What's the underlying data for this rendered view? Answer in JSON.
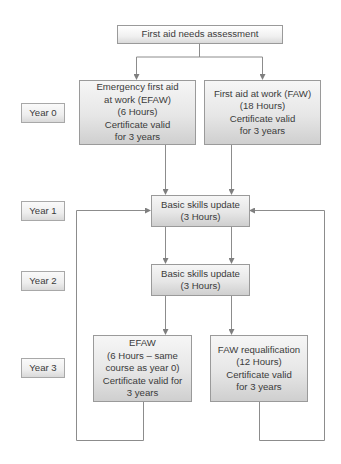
{
  "diagram": {
    "title": "First aid needs assessment",
    "years": [
      {
        "label": "Year 0"
      },
      {
        "label": "Year 1"
      },
      {
        "label": "Year 2"
      },
      {
        "label": "Year 3"
      }
    ],
    "nodes": {
      "assessment": {
        "lines": [
          "First aid needs assessment"
        ]
      },
      "efaw_year0": {
        "lines": [
          "Emergency first aid",
          "at work (EFAW)",
          "(6 Hours)",
          "Certificate valid",
          "for 3 years"
        ]
      },
      "faw_year0": {
        "lines": [
          "First aid at work (FAW)",
          "(18 Hours)",
          "Certificate valid",
          "for 3 years"
        ]
      },
      "basic_year1": {
        "lines": [
          "Basic skills update",
          "(3 Hours)"
        ]
      },
      "basic_year2": {
        "lines": [
          "Basic skills update",
          "(3 Hours)"
        ]
      },
      "efaw_year3": {
        "lines": [
          "EFAW",
          "(6 Hours – same",
          "course as year 0)",
          "Certificate valid for",
          "3 years"
        ]
      },
      "faw_requal_year3": {
        "lines": [
          "FAW requalification",
          "(12 Hours)",
          "Certificate valid",
          "for 3 years"
        ]
      }
    },
    "edges": [
      {
        "from": "assessment",
        "to": "efaw_year0"
      },
      {
        "from": "assessment",
        "to": "faw_year0"
      },
      {
        "from": "efaw_year0",
        "to": "basic_year1"
      },
      {
        "from": "faw_year0",
        "to": "basic_year1"
      },
      {
        "from": "basic_year1",
        "to": "basic_year2"
      },
      {
        "from": "basic_year1",
        "to": "basic_year2"
      },
      {
        "from": "basic_year2",
        "to": "efaw_year3"
      },
      {
        "from": "basic_year2",
        "to": "faw_requal_year3"
      },
      {
        "from": "efaw_year3",
        "to": "basic_year1",
        "type": "loop-back"
      },
      {
        "from": "faw_requal_year3",
        "to": "basic_year1",
        "type": "loop-back"
      }
    ],
    "colors": {
      "line": "#8c8c8c",
      "box_border": "#9a9a9a",
      "box_fill_top": "#f6f6f6",
      "box_fill_bottom": "#cfcfcf",
      "text": "#3b3b3b"
    }
  }
}
